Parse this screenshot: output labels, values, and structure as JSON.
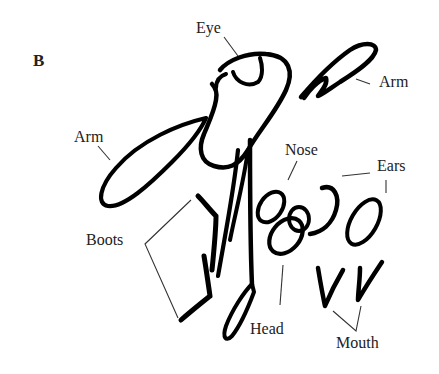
{
  "figure": {
    "panel_label": "B",
    "labels": {
      "eye": "Eye",
      "arm_right": "Arm",
      "arm_left": "Arm",
      "nose": "Nose",
      "ears": "Ears",
      "boots": "Boots",
      "head": "Head",
      "mouth": "Mouth"
    },
    "colors": {
      "ink": "#000000",
      "leader": "#333333",
      "background": "#ffffff"
    }
  }
}
